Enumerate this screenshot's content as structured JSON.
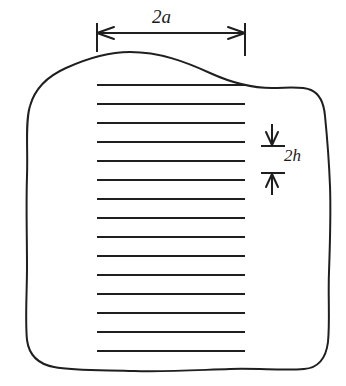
{
  "figure": {
    "ink_color": "#1f1f1f",
    "background_color": "#ffffff",
    "width_label": "2a",
    "spacing_label": "2h",
    "width_dimension": {
      "label": "2a",
      "left_tick_x": 97,
      "right_tick_x": 245,
      "arrow_y": 33,
      "tick_top_y": 23,
      "tick_bottom_y": 52
    },
    "spacing_dimension": {
      "label": "2h",
      "tick_x_start": 261,
      "tick_x_end": 285,
      "top_tick_y": 146,
      "bottom_tick_y": 173,
      "arrow_direction": "inward"
    },
    "crack_lines": {
      "count": 15,
      "x_start": 97,
      "x_end": 245,
      "y_values": [
        85,
        104,
        123,
        142,
        161,
        180,
        199,
        218,
        237,
        256,
        275,
        294,
        313,
        332,
        351
      ],
      "stroke_width": 2.1
    },
    "body_outline": {
      "type": "irregular-blob",
      "stroke_width": 2.0,
      "description": "hand-drawn closed wavy boundary enclosing the crack array"
    }
  }
}
